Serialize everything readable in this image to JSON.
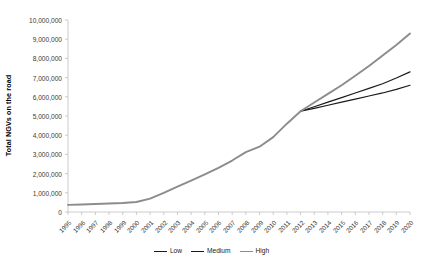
{
  "chart_data": {
    "type": "line",
    "title": "",
    "xlabel": "",
    "ylabel": "Total NGVs on the road",
    "xlim": [
      1995,
      2020
    ],
    "ylim": [
      0,
      10000000
    ],
    "ytick_values": [
      0,
      1000000,
      2000000,
      3000000,
      4000000,
      5000000,
      6000000,
      7000000,
      8000000,
      9000000,
      10000000
    ],
    "ytick_labels": [
      "0",
      "1,000,000",
      "2,000,000",
      "3,000,000",
      "4,000,000",
      "5,000,000",
      "6,000,000",
      "7,000,000",
      "8,000,000",
      "9,000,000",
      "10,000,000"
    ],
    "categories": [
      1995,
      1996,
      1997,
      1998,
      1999,
      2000,
      2001,
      2002,
      2003,
      2004,
      2005,
      2006,
      2007,
      2008,
      2009,
      2010,
      2011,
      2012,
      2013,
      2014,
      2015,
      2016,
      2017,
      2018,
      2019,
      2020
    ],
    "xtick_labels": [
      "1995",
      "1996",
      "1997",
      "1998",
      "1999",
      "2000",
      "2001",
      "2002",
      "2003",
      "2004",
      "2005",
      "2006",
      "2007",
      "2008",
      "2009",
      "2010",
      "2011",
      "2012",
      "2013",
      "2014",
      "2015",
      "2016",
      "2017",
      "2018",
      "2019",
      "2020"
    ],
    "grid": false,
    "legend_position": "bottom",
    "series": [
      {
        "name": "Low",
        "color": "#1a1a1a",
        "values": [
          null,
          null,
          null,
          null,
          null,
          null,
          null,
          null,
          null,
          null,
          null,
          null,
          null,
          null,
          null,
          null,
          null,
          5250000,
          5400000,
          5560000,
          5720000,
          5880000,
          6040000,
          6200000,
          6390000,
          6600000
        ]
      },
      {
        "name": "Medium",
        "color": "#1a1a1a",
        "values": [
          null,
          null,
          null,
          null,
          null,
          null,
          null,
          null,
          null,
          null,
          null,
          null,
          null,
          null,
          null,
          null,
          null,
          5250000,
          5480000,
          5720000,
          5960000,
          6200000,
          6440000,
          6680000,
          6980000,
          7300000
        ]
      },
      {
        "name": "High",
        "color": "#8c8c8c",
        "values": [
          370000,
          390000,
          415000,
          440000,
          470000,
          520000,
          700000,
          1000000,
          1320000,
          1640000,
          1960000,
          2300000,
          2680000,
          3120000,
          3400000,
          3900000,
          4600000,
          5250000,
          5700000,
          6150000,
          6600000,
          7100000,
          7600000,
          8150000,
          8700000,
          9300000
        ]
      }
    ]
  },
  "legend": {
    "items": [
      {
        "label": "Low",
        "color": "#1a1a1a"
      },
      {
        "label": "Medium",
        "color": "#1a1a1a"
      },
      {
        "label": "High",
        "color": "#8c8c8c"
      }
    ]
  },
  "axes": {
    "axis_color": "#bfbfbf",
    "tick_color": "#bfbfbf",
    "label_color": "#3a3a3a"
  }
}
